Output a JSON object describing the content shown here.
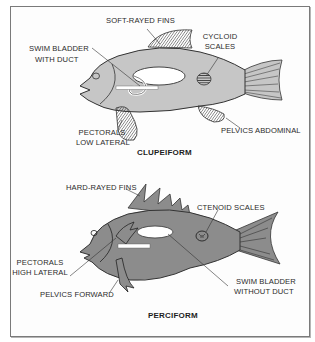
{
  "colors": {
    "frame": "#7a7a7a",
    "clupeiform_body": "#c6c6c6",
    "perciform_body": "#8c8c8c",
    "outline": "#3a3a3a",
    "bladder": "#ffffff"
  },
  "clupeiform": {
    "title": "CLUPEIFORM",
    "labels": {
      "soft_rayed_fins": "SOFT-RAYED FINS",
      "cycloid_scales_line1": "CYCLOID",
      "cycloid_scales_line2": "SCALES",
      "swim_bladder_line1": "SWIM BLADDER",
      "swim_bladder_line2": "WITH DUCT",
      "pectorals_line1": "PECTORALS",
      "pectorals_line2": "LOW LATERAL",
      "pelvics": "PELVICS ABDOMINAL"
    }
  },
  "perciform": {
    "title": "PERCIFORM",
    "labels": {
      "hard_rayed_fins": "HARD-RAYED FINS",
      "ctenoid_scales": "CTENOID SCALES",
      "pectorals_line1": "PECTORALS",
      "pectorals_line2": "HIGH LATERAL",
      "pelvics": "PELVICS FORWARD",
      "swim_bladder_line1": "SWIM BLADDER",
      "swim_bladder_line2": "WITHOUT DUCT"
    }
  }
}
